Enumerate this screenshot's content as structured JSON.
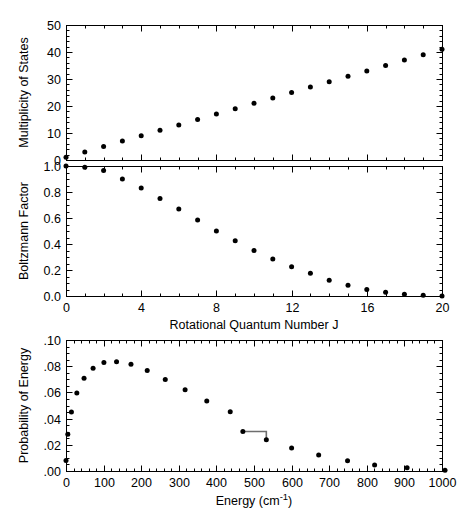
{
  "figure": {
    "background_color": "#ffffff",
    "marker_color": "#000000",
    "axis_color": "#000000",
    "connector_color": "#6e6e6e",
    "width": 471,
    "height": 517
  },
  "chart_data": [
    {
      "type": "scatter",
      "id": "multiplicity-panel",
      "title": "",
      "xlabel": "",
      "ylabel": "Multiplicity of States",
      "xlim": [
        0,
        20
      ],
      "ylim": [
        0,
        50
      ],
      "xticks": [
        0,
        4,
        8,
        12,
        16,
        20
      ],
      "xticklabels": [
        "",
        "",
        "",
        "",
        "",
        ""
      ],
      "yticks": [
        0,
        10,
        20,
        30,
        40,
        50
      ],
      "yticklabels": [
        "0",
        "10",
        "20",
        "30",
        "40",
        "50"
      ],
      "x_minor_interval": 1,
      "y_minor_interval": 2,
      "grid": false,
      "legend": null,
      "x": [
        0,
        1,
        2,
        3,
        4,
        5,
        6,
        7,
        8,
        9,
        10,
        11,
        12,
        13,
        14,
        15,
        16,
        17,
        18,
        19,
        20
      ],
      "values": [
        1,
        3,
        5,
        7,
        9,
        11,
        13,
        15,
        17,
        19,
        21,
        23,
        25,
        27,
        29,
        31,
        33,
        35,
        37,
        39,
        41
      ]
    },
    {
      "type": "scatter",
      "id": "boltzmann-panel",
      "title": "",
      "xlabel": "Rotational Quantum Number J",
      "ylabel": "Boltzmann Factor",
      "xlim": [
        0,
        20
      ],
      "ylim": [
        0.0,
        1.0
      ],
      "xticks": [
        0,
        4,
        8,
        12,
        16,
        20
      ],
      "xticklabels": [
        "0",
        "4",
        "8",
        "12",
        "16",
        "20"
      ],
      "yticks": [
        0.0,
        0.2,
        0.4,
        0.6,
        0.8,
        1.0
      ],
      "yticklabels": [
        "0.0",
        "0.2",
        "0.4",
        "0.6",
        "0.8",
        "1.0"
      ],
      "x_minor_interval": 1,
      "y_minor_interval": 0.05,
      "grid": false,
      "legend": null,
      "x": [
        0,
        1,
        2,
        3,
        4,
        5,
        6,
        7,
        8,
        9,
        10,
        11,
        12,
        13,
        14,
        15,
        16,
        17,
        18,
        19,
        20
      ],
      "values": [
        1.0,
        0.99,
        0.965,
        0.9,
        0.83,
        0.75,
        0.67,
        0.585,
        0.5,
        0.425,
        0.35,
        0.285,
        0.225,
        0.175,
        0.122,
        0.082,
        0.05,
        0.028,
        0.013,
        0.006,
        0.0
      ]
    },
    {
      "type": "scatter",
      "id": "probability-panel",
      "title": "",
      "xlabel": "Energy (cm-1)",
      "xlabel_base": "Energy (cm",
      "xlabel_super": "-1",
      "xlabel_tail": ")",
      "ylabel": "Probability of Energy",
      "xlim": [
        0,
        1000
      ],
      "ylim": [
        0.0,
        0.1
      ],
      "xticks": [
        0,
        100,
        200,
        300,
        400,
        500,
        600,
        700,
        800,
        900,
        1000
      ],
      "xticklabels": [
        "0",
        "100",
        "200",
        "300",
        "400",
        "500",
        "600",
        "700",
        "800",
        "900",
        "1000"
      ],
      "yticks": [
        0.0,
        0.02,
        0.04,
        0.06,
        0.08,
        0.1
      ],
      "yticklabels": [
        ".00",
        ".02",
        ".04",
        ".06",
        ".08",
        ".10"
      ],
      "x_minor_interval": 20,
      "y_minor_interval": 0.005,
      "grid": false,
      "legend": null,
      "x": [
        0,
        4.8,
        14.4,
        28.8,
        48,
        72,
        100.8,
        134.4,
        172.8,
        216,
        264,
        316.8,
        374.4,
        436.8,
        470.4,
        532.8,
        600,
        672,
        748.8,
        820.8,
        907.2,
        1008
      ],
      "values": [
        0.008,
        0.028,
        0.045,
        0.0595,
        0.0708,
        0.0785,
        0.0828,
        0.0834,
        0.0815,
        0.0768,
        0.0698,
        0.062,
        0.0535,
        0.0452,
        0.0302,
        0.0238,
        0.0175,
        0.0122,
        0.0078,
        0.0046,
        0.0024,
        0.0006
      ],
      "annotations": [
        {
          "name": "step-connector",
          "type": "step-line",
          "from": {
            "x": 470.4,
            "y": 0.0302
          },
          "to": {
            "x": 532.8,
            "y": 0.0238
          },
          "color": "#6e6e6e"
        }
      ]
    }
  ]
}
